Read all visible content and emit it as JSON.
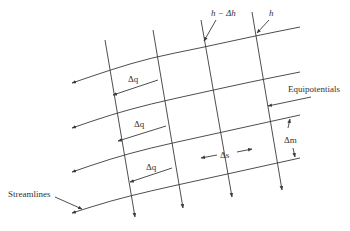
{
  "diagram": {
    "colors": {
      "line": "#3a3a3a",
      "text": "#333333",
      "background": "#ffffff"
    },
    "streamlines": [
      {
        "points": [
          [
            300,
            27
          ],
          [
            250,
            37
          ],
          [
            200,
            48
          ],
          [
            150,
            58
          ],
          [
            110,
            70
          ],
          [
            72,
            83
          ]
        ]
      },
      {
        "points": [
          [
            300,
            72
          ],
          [
            250,
            82
          ],
          [
            200,
            93
          ],
          [
            150,
            104
          ],
          [
            110,
            115
          ],
          [
            72,
            128
          ]
        ]
      },
      {
        "points": [
          [
            300,
            115
          ],
          [
            250,
            126
          ],
          [
            200,
            137
          ],
          [
            150,
            148
          ],
          [
            110,
            159
          ],
          [
            72,
            172
          ]
        ]
      },
      {
        "points": [
          [
            300,
            158
          ],
          [
            250,
            169
          ],
          [
            200,
            180
          ],
          [
            150,
            191
          ],
          [
            110,
            201
          ],
          [
            72,
            213
          ]
        ]
      }
    ],
    "equipotentials": [
      {
        "points": [
          [
            105,
            40
          ],
          [
            135,
            217
          ]
        ]
      },
      {
        "points": [
          [
            153,
            30
          ],
          [
            183,
            208
          ]
        ]
      },
      {
        "points": [
          [
            201,
            20
          ],
          [
            232,
            197
          ]
        ]
      },
      {
        "points": [
          [
            252,
            12
          ],
          [
            282,
            190
          ]
        ]
      }
    ],
    "dimension_arrows": [
      {
        "from": [
          158,
          80
        ],
        "to": [
          113,
          95
        ],
        "label": "Δq",
        "label_pos": [
          128,
          82
        ]
      },
      {
        "from": [
          166,
          126
        ],
        "to": [
          118,
          141
        ],
        "label": "Δq",
        "label_pos": [
          134,
          127
        ]
      },
      {
        "from": [
          172,
          168
        ],
        "to": [
          130,
          182
        ],
        "label": "Δq",
        "label_pos": [
          146,
          170
        ]
      },
      {
        "from": [
          217,
          155
        ],
        "to": [
          201,
          158
        ],
        "label": "Δs",
        "label_pos": [
          220,
          158
        ]
      },
      {
        "from": [
          237,
          152
        ],
        "to": [
          252,
          149
        ],
        "label": "",
        "label_pos": [
          0,
          0
        ]
      },
      {
        "from": [
          288,
          128
        ],
        "to": [
          290,
          119
        ],
        "label": "Δm",
        "label_pos": [
          284,
          143
        ]
      },
      {
        "from": [
          293,
          148
        ],
        "to": [
          295,
          157
        ],
        "label": "",
        "label_pos": [
          0,
          0
        ]
      }
    ],
    "annotations": [
      {
        "text": "h − Δh",
        "pos": [
          211,
          16
        ],
        "italic": true,
        "leader_from": [
          216,
          20
        ],
        "leader_to": [
          204,
          41
        ]
      },
      {
        "text": "h",
        "pos": [
          269,
          16
        ],
        "italic": true,
        "leader_from": [
          269,
          20
        ],
        "leader_to": [
          257,
          33
        ]
      },
      {
        "text": "Equipotentials",
        "pos": [
          288,
          92
        ],
        "italic": false,
        "leader_from": [
          311,
          97
        ],
        "leader_to": [
          268,
          106
        ]
      },
      {
        "text": "Streamlines",
        "pos": [
          8,
          197
        ],
        "italic": false,
        "leader_from": [
          55,
          197
        ],
        "leader_to": [
          82,
          209
        ]
      }
    ]
  }
}
